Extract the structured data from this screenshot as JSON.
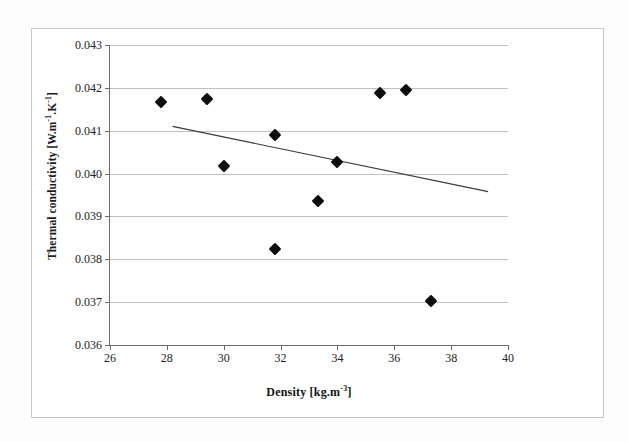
{
  "figure": {
    "background_color": "#fdfdfd",
    "frame_color": "#c9c9c9"
  },
  "chart_data": {
    "type": "scatter",
    "title": "",
    "xlabel": "Density [kg.m-3]",
    "xlabel_base": "Density [kg.m",
    "xlabel_exponent": "-3",
    "xlabel_tail": "]",
    "ylabel": "Thermal conductivity [W.m-1.K-1]",
    "ylabel_part1": "Thermal conductivity [W.m",
    "ylabel_exp1": "-1",
    "ylabel_part2": ".K",
    "ylabel_exp2": "-1",
    "ylabel_part3": "]",
    "xlim": [
      26,
      40
    ],
    "ylim": [
      0.036,
      0.043
    ],
    "xticks": [
      26,
      28,
      30,
      32,
      34,
      36,
      38,
      40
    ],
    "xtick_labels": [
      "26",
      "28",
      "30",
      "32",
      "34",
      "36",
      "38",
      "40"
    ],
    "yticks": [
      0.036,
      0.037,
      0.038,
      0.039,
      0.04,
      0.041,
      0.042,
      0.043
    ],
    "ytick_labels": [
      "0.036",
      "0.037",
      "0.038",
      "0.039",
      "0.040",
      "0.041",
      "0.042",
      "0.043"
    ],
    "grid": "horizontal",
    "legend": "none",
    "marker_shape": "diamond",
    "marker_color": "#0c0c0c",
    "marker_size_px": 9,
    "points": [
      {
        "x": 27.8,
        "y": 0.04167
      },
      {
        "x": 29.4,
        "y": 0.04174
      },
      {
        "x": 30.0,
        "y": 0.04017
      },
      {
        "x": 31.8,
        "y": 0.0409
      },
      {
        "x": 31.8,
        "y": 0.03824
      },
      {
        "x": 33.3,
        "y": 0.03937
      },
      {
        "x": 34.0,
        "y": 0.04028
      },
      {
        "x": 35.5,
        "y": 0.04187
      },
      {
        "x": 36.4,
        "y": 0.04196
      },
      {
        "x": 37.3,
        "y": 0.03703
      }
    ],
    "trendline": {
      "type": "linear",
      "color": "#3a3a3a",
      "width_px": 1.2,
      "x_start": 28.2,
      "y_start": 0.0411,
      "x_end": 39.3,
      "y_end": 0.03958
    }
  }
}
